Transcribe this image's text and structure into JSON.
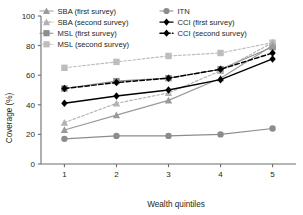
{
  "chart_data": {
    "type": "line",
    "title": "",
    "xlabel": "Wealth quintiles",
    "ylabel": "Coverage (%)",
    "x": [
      1,
      2,
      3,
      4,
      5
    ],
    "xtick_labels": [
      "1",
      "2",
      "3",
      "4",
      "5"
    ],
    "ytick_labels": [
      "0",
      "20",
      "40",
      "60",
      "80",
      "100"
    ],
    "yticks": [
      0,
      20,
      40,
      60,
      80,
      100
    ],
    "ylim": [
      0,
      100
    ],
    "xlim": [
      0.55,
      5.45
    ],
    "grid": false,
    "legend_position": "top-inside-two-columns",
    "series": [
      {
        "name": "SBA (first survey)",
        "label": "SBA (first survey)",
        "values": [
          23,
          33,
          43,
          58,
          80
        ],
        "color": "#9a9a9a",
        "marker": "triangle",
        "line": "solid"
      },
      {
        "name": "SBA (second survey)",
        "label": "SBA (second survey)",
        "values": [
          28,
          41,
          48,
          63,
          82
        ],
        "color": "#b3b3b3",
        "marker": "triangle",
        "line": "dashed"
      },
      {
        "name": "MSL (first survey)",
        "label": "MSL (first survey)",
        "values": [
          51,
          56,
          58,
          64,
          79
        ],
        "color": "#8c8c8c",
        "marker": "square",
        "line": "solid"
      },
      {
        "name": "MSL (second survey)",
        "label": "MSL (second survey)",
        "values": [
          65,
          69,
          73,
          75,
          82
        ],
        "color": "#bdbdbd",
        "marker": "square",
        "line": "dashed"
      },
      {
        "name": "ITN",
        "label": "ITN",
        "values": [
          17,
          19,
          19,
          20,
          24
        ],
        "color": "#8c8c8c",
        "marker": "circle",
        "line": "solid"
      },
      {
        "name": "CCI (first survey)",
        "label": "CCI (first survey)",
        "values": [
          41,
          46,
          50,
          57,
          71
        ],
        "color": "#000000",
        "marker": "diamond",
        "line": "solid"
      },
      {
        "name": "CCI (second survey)",
        "label": "CCI (second survey)",
        "values": [
          51,
          55,
          58,
          64,
          75
        ],
        "color": "#000000",
        "marker": "diamond",
        "line": "dashed"
      }
    ]
  },
  "axes": {
    "y_title": "Coverage (%)",
    "x_title": "Wealth quintiles"
  },
  "colors": {
    "axis": "#6d6d6d",
    "text": "#231f20",
    "background": "#ffffff"
  }
}
